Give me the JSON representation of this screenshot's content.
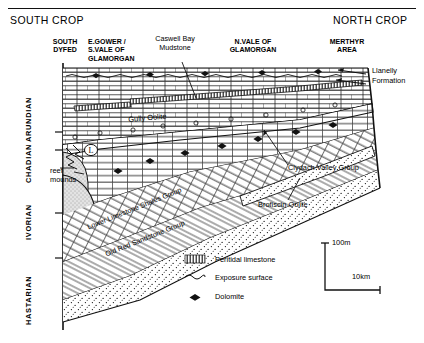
{
  "figure": {
    "type": "geological-cross-section",
    "top_rule": true
  },
  "crop_labels": {
    "south": "SOUTH CROP",
    "north": "NORTH CROP"
  },
  "regions": [
    {
      "id": "south-dyfed",
      "lines": [
        "SOUTH",
        "DYFED"
      ]
    },
    {
      "id": "e-gower-s-vale",
      "lines": [
        "E.GOWER /",
        "S.VALE OF",
        "GLAMORGAN"
      ]
    },
    {
      "id": "caswell-bay-mudstone",
      "lines": [
        "Caswell Bay",
        "Mudstone"
      ]
    },
    {
      "id": "n-vale-glamorgan",
      "lines": [
        "N.VALE OF",
        "GLAMORGAN"
      ]
    },
    {
      "id": "merthyr-area",
      "lines": [
        "MERTHYR",
        "AREA"
      ]
    }
  ],
  "stages": [
    {
      "id": "arundian",
      "label": "ARUNDIAN"
    },
    {
      "id": "chadian",
      "label": "CHADIAN"
    },
    {
      "id": "ivorian",
      "label": "IVORIAN"
    },
    {
      "id": "hastarian",
      "label": "HASTARIAN"
    }
  ],
  "units": {
    "gully_oolite": "Gully Oolite",
    "llanelly_formation": [
      "Llanelly",
      "Formation"
    ],
    "clydach_valley_group": "Clydach Valley Group",
    "brofiscin_oolite": "Brofiscin Oolite",
    "reef_mounds": [
      "reef",
      "mounds"
    ],
    "lower_limestone_shales_group": "Lower Limestone Shales Group",
    "old_red_sandstone_group": "Old Red Sandstone Group",
    "l_marker": "L"
  },
  "legend": {
    "items": [
      {
        "id": "peritidal-limestone",
        "label": "Peritidal limestone",
        "symbol": "vertical-hatch-box"
      },
      {
        "id": "exposure-surface",
        "label": "Exposure surface",
        "symbol": "wavy-line"
      },
      {
        "id": "dolomite",
        "label": "Dolomite",
        "symbol": "rhomb"
      }
    ]
  },
  "scale": {
    "vertical": "100m",
    "horizontal": "10km"
  },
  "colors": {
    "ink": "#111111",
    "paper": "#ffffff",
    "stipple": "#d8d8d8"
  }
}
